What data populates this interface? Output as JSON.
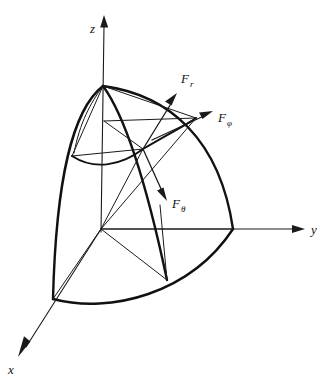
{
  "figure": {
    "background_color": "#ffffff",
    "line_color": "#1a1a1a"
  },
  "axes": [
    {
      "id": "z",
      "label": "z",
      "label_x": 90,
      "label_y": 33,
      "origin_x": 101,
      "origin_y": 229,
      "tip_x": 105,
      "tip_y": 16,
      "direction": "up"
    },
    {
      "id": "y",
      "label": "y",
      "label_x": 311,
      "label_y": 234,
      "origin_x": 101,
      "origin_y": 229,
      "tip_x": 303,
      "tip_y": 229,
      "direction": "right"
    },
    {
      "id": "x",
      "label": "x",
      "label_x": 8,
      "label_y": 374,
      "origin_x": 101,
      "origin_y": 229,
      "tip_x": 19,
      "tip_y": 355,
      "direction": "down-left"
    }
  ],
  "vectors": [
    {
      "id": "F_r",
      "label_main": "F",
      "label_sub": "r",
      "label_x": 181,
      "label_y": 83,
      "start_x": 143,
      "start_y": 149,
      "tip_x": 177,
      "tip_y": 94,
      "description": "radial force component"
    },
    {
      "id": "F_phi",
      "label_main": "F",
      "label_sub": "φ",
      "label_x": 218,
      "label_y": 122,
      "start_x": 152,
      "start_y": 140,
      "tip_x": 212,
      "tip_y": 112,
      "description": "azimuthal force component"
    },
    {
      "id": "F_theta",
      "label_main": "F",
      "label_sub": "θ",
      "label_x": 172,
      "label_y": 208,
      "start_x": 143,
      "start_y": 149,
      "tip_x": 166,
      "tip_y": 200,
      "description": "polar force component"
    }
  ],
  "geometry": {
    "origin": {
      "x": 101,
      "y": 229
    },
    "pole": {
      "x": 103,
      "y": 86
    },
    "surface_point": {
      "x": 143,
      "y": 149
    },
    "outer_radius_note": "spherical octant surface patch",
    "inner_radius_note": "inner cone and sphere construction lines"
  }
}
